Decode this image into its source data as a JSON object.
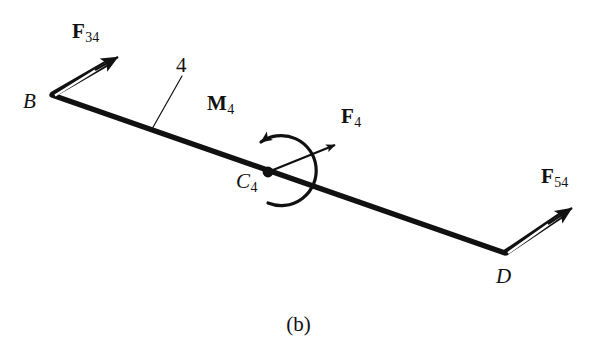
{
  "figure": {
    "caption": "(b)",
    "background_color": "#ffffff",
    "stroke_color": "#111111",
    "width": 597,
    "height": 356,
    "type": "free-body-diagram"
  },
  "body": {
    "link_label": "4",
    "name": "link-4-bar"
  },
  "points": [
    {
      "id": "B",
      "label": "B",
      "sub": "",
      "x": 52,
      "y": 95
    },
    {
      "id": "C4",
      "label": "C",
      "sub": "4",
      "x": 268,
      "y": 172
    },
    {
      "id": "D",
      "label": "D",
      "sub": "",
      "x": 505,
      "y": 253
    }
  ],
  "vectors": [
    {
      "id": "F34",
      "base": "F",
      "sub": "34",
      "style": "hollow-double-line",
      "from": "B",
      "tail_x": 52,
      "tail_y": 95,
      "tip_x": 118,
      "tip_y": 57
    },
    {
      "id": "F4",
      "base": "F",
      "sub": "4",
      "style": "thin-solid-line",
      "from": "C4",
      "tail_x": 268,
      "tail_y": 172,
      "tip_x": 335,
      "tip_y": 145
    },
    {
      "id": "F54",
      "base": "F",
      "sub": "54",
      "style": "hollow-double-line",
      "from": "D",
      "tail_x": 505,
      "tail_y": 253,
      "tip_x": 572,
      "tip_y": 208
    }
  ],
  "moment": {
    "id": "M4",
    "base": "M",
    "sub": "4",
    "sense": "counterclockwise",
    "at": "C4",
    "center_x": 288,
    "center_y": 170,
    "radius": 35
  }
}
